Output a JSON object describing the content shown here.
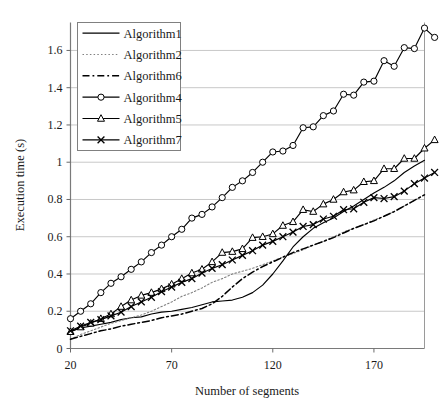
{
  "chart_data": {
    "type": "line",
    "title": "",
    "xlabel": "Number of segments",
    "ylabel": "Execution time (s)",
    "xlim": [
      20,
      195
    ],
    "ylim": [
      0,
      1.75
    ],
    "xticks": [
      20,
      70,
      120,
      170
    ],
    "yticks": [
      0,
      0.2,
      0.4,
      0.6,
      0.8,
      1,
      1.2,
      1.4,
      1.6
    ],
    "ytick_labels": [
      "0",
      "0.2",
      "0.4",
      "0.6",
      "0.8",
      "1",
      "1.2",
      "1.4",
      "1.6"
    ],
    "xtick_labels": [
      "20",
      "70",
      "120",
      "170"
    ],
    "grid": "horizontal",
    "legend_position": "top-left",
    "x": [
      20,
      25,
      30,
      35,
      40,
      45,
      50,
      55,
      60,
      65,
      70,
      75,
      80,
      85,
      90,
      95,
      100,
      105,
      110,
      115,
      120,
      125,
      130,
      135,
      140,
      145,
      150,
      155,
      160,
      165,
      170,
      175,
      180,
      185,
      190,
      195
    ],
    "series": [
      {
        "name": "Algorithm1",
        "style": "solid",
        "marker": "none",
        "color": "#000000",
        "values": [
          0.09,
          0.11,
          0.12,
          0.13,
          0.14,
          0.155,
          0.165,
          0.17,
          0.185,
          0.195,
          0.2,
          0.21,
          0.22,
          0.235,
          0.25,
          0.255,
          0.26,
          0.275,
          0.3,
          0.34,
          0.4,
          0.47,
          0.545,
          0.6,
          0.645,
          0.675,
          0.7,
          0.735,
          0.765,
          0.8,
          0.835,
          0.865,
          0.9,
          0.945,
          0.98,
          1.01
        ]
      },
      {
        "name": "Algorithm2",
        "style": "dotted",
        "marker": "none",
        "color": "#808080",
        "values": [
          0.05,
          0.075,
          0.095,
          0.115,
          0.135,
          0.15,
          0.165,
          0.18,
          0.2,
          0.225,
          0.25,
          0.28,
          0.3,
          0.325,
          0.355,
          0.375,
          0.4,
          0.415,
          0.43,
          0.45,
          0.47,
          0.49,
          0.51,
          0.53,
          0.555,
          0.575,
          0.6,
          0.625,
          0.645,
          0.665,
          0.69,
          0.71,
          0.735,
          0.765,
          0.795,
          0.825
        ]
      },
      {
        "name": "Algorithm6",
        "style": "dashdot",
        "marker": "none",
        "color": "#000000",
        "values": [
          0.05,
          0.065,
          0.08,
          0.095,
          0.105,
          0.12,
          0.13,
          0.14,
          0.15,
          0.165,
          0.175,
          0.185,
          0.2,
          0.215,
          0.24,
          0.28,
          0.33,
          0.375,
          0.41,
          0.44,
          0.465,
          0.49,
          0.515,
          0.535,
          0.555,
          0.575,
          0.595,
          0.62,
          0.645,
          0.665,
          0.685,
          0.71,
          0.735,
          0.765,
          0.795,
          0.825
        ]
      },
      {
        "name": "Algorithm4",
        "style": "solid",
        "marker": "circle",
        "color": "#000000",
        "values": [
          0.16,
          0.2,
          0.24,
          0.3,
          0.35,
          0.385,
          0.425,
          0.465,
          0.515,
          0.555,
          0.6,
          0.64,
          0.7,
          0.72,
          0.76,
          0.81,
          0.865,
          0.9,
          0.945,
          1.0,
          1.055,
          1.06,
          1.09,
          1.185,
          1.19,
          1.25,
          1.275,
          1.365,
          1.36,
          1.43,
          1.435,
          1.545,
          1.515,
          1.615,
          1.61,
          1.72
        ]
      },
      {
        "name": "Algorithm5",
        "style": "solid",
        "marker": "triangle",
        "color": "#000000",
        "values": [
          0.09,
          0.115,
          0.135,
          0.16,
          0.185,
          0.225,
          0.26,
          0.285,
          0.3,
          0.32,
          0.345,
          0.375,
          0.405,
          0.425,
          0.465,
          0.515,
          0.52,
          0.535,
          0.595,
          0.6,
          0.615,
          0.66,
          0.68,
          0.745,
          0.735,
          0.775,
          0.8,
          0.84,
          0.85,
          0.895,
          0.9,
          0.965,
          0.965,
          1.02,
          1.02,
          1.075
        ]
      },
      {
        "name": "Algorithm7",
        "style": "solid",
        "marker": "cross",
        "color": "#000000",
        "values": [
          0.095,
          0.12,
          0.14,
          0.155,
          0.175,
          0.195,
          0.225,
          0.25,
          0.275,
          0.305,
          0.33,
          0.355,
          0.375,
          0.405,
          0.43,
          0.45,
          0.475,
          0.5,
          0.525,
          0.555,
          0.575,
          0.6,
          0.625,
          0.655,
          0.665,
          0.695,
          0.71,
          0.745,
          0.75,
          0.785,
          0.81,
          0.805,
          0.815,
          0.845,
          0.885,
          0.915
        ]
      }
    ],
    "series_tail": [
      {
        "name": "Algorithm4",
        "x": 200,
        "y": 1.67
      },
      {
        "name": "Algorithm5",
        "x": 200,
        "y": 1.12
      },
      {
        "name": "Algorithm7",
        "x": 200,
        "y": 0.945
      }
    ]
  }
}
